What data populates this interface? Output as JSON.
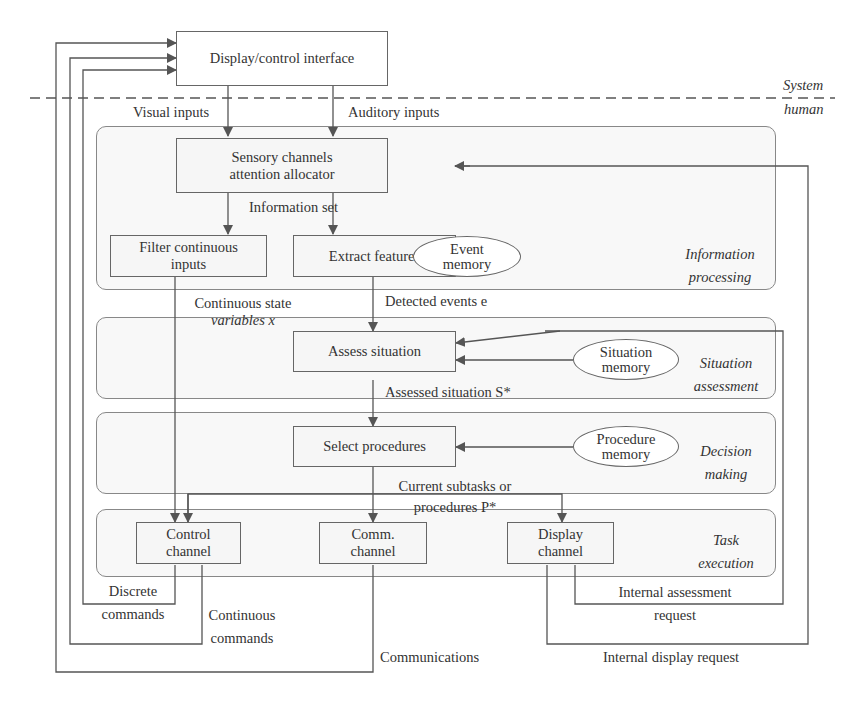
{
  "boundary": {
    "system_label": "System",
    "human_label": "human"
  },
  "interface_box": {
    "label": "Display/control interface"
  },
  "inputs": {
    "visual": "Visual inputs",
    "auditory": "Auditory inputs"
  },
  "panels": {
    "information_processing": {
      "label_line1": "Information",
      "label_line2": "processing"
    },
    "situation_assessment": {
      "label_line1": "Situation",
      "label_line2": "assessment"
    },
    "decision_making": {
      "label_line1": "Decision",
      "label_line2": "making"
    },
    "task_execution": {
      "label_line1": "Task",
      "label_line2": "execution"
    }
  },
  "nodes": {
    "sensory": {
      "line1": "Sensory channels",
      "line2": "attention allocator"
    },
    "filter": {
      "line1": "Filter continuous",
      "line2": "inputs"
    },
    "extract": {
      "label": "Extract features"
    },
    "event_memory": {
      "line1": "Event",
      "line2": "memory"
    },
    "assess": {
      "label": "Assess situation"
    },
    "situation_memory": {
      "line1": "Situation",
      "line2": "memory"
    },
    "select": {
      "label": "Select procedures"
    },
    "procedure_memory": {
      "line1": "Procedure",
      "line2": "memory"
    },
    "control": {
      "line1": "Control",
      "line2": "channel"
    },
    "comm": {
      "line1": "Comm.",
      "line2": "channel"
    },
    "display": {
      "line1": "Display",
      "line2": "channel"
    }
  },
  "edge_labels": {
    "information_set": "Information set",
    "continuous_state_line1": "Continuous state",
    "continuous_state_line2": "variables x",
    "detected_events": "Detected events e",
    "assessed_situation": "Assessed situation S*",
    "current_subtasks_line1": "Current subtasks or",
    "current_subtasks_line2": "procedures P*",
    "discrete_commands_line1": "Discrete",
    "discrete_commands_line2": "commands",
    "continuous_commands_line1": "Continuous",
    "continuous_commands_line2": "commands",
    "communications": "Communications",
    "internal_assessment_line1": "Internal assessment",
    "internal_assessment_line2": "request",
    "internal_display": "Internal display request"
  },
  "colors": {
    "line": "#555555",
    "box_border": "#666666",
    "panel_fill": "#f8f8f8",
    "text": "#333333"
  }
}
